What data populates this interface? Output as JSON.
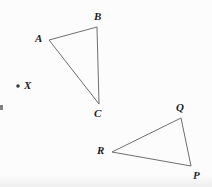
{
  "figure": {
    "background_color": "#fcfcfc",
    "line_color": "#6e6e6e",
    "label_color": "#1c1c1c",
    "width": 212,
    "height": 187
  },
  "shapes": {
    "triangle_abc": {
      "name": "Triangle ABC",
      "vertices": [
        {
          "label": "A",
          "x": 49,
          "y": 40,
          "label_x": 35,
          "label_y": 33
        },
        {
          "label": "B",
          "x": 97,
          "y": 27,
          "label_x": 94,
          "label_y": 11
        },
        {
          "label": "C",
          "x": 99,
          "y": 104,
          "label_x": 94,
          "label_y": 108
        }
      ]
    },
    "triangle_qrp": {
      "name": "Triangle QRP",
      "vertices": [
        {
          "label": "Q",
          "x": 181,
          "y": 118,
          "label_x": 176,
          "label_y": 102
        },
        {
          "label": "R",
          "x": 112,
          "y": 152,
          "label_x": 97,
          "label_y": 145
        },
        {
          "label": "P",
          "x": 191,
          "y": 166,
          "label_x": 193,
          "label_y": 170
        }
      ]
    },
    "point_x": {
      "name": "Point X",
      "label": "X",
      "x": 18,
      "y": 86,
      "label_x": 24,
      "label_y": 80,
      "dot_radius": 1.8
    }
  }
}
